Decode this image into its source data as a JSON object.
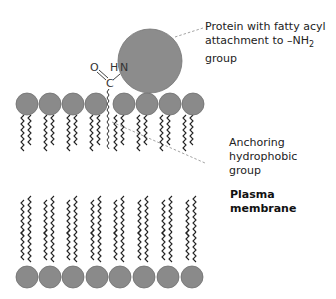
{
  "diagram": {
    "labels": {
      "protein_line1": "Protein with fatty acyl",
      "protein_line2": "attachment to –NH",
      "protein_sub": "2",
      "protein_tail": " group",
      "anchor_line1": "Anchoring",
      "anchor_line2": "hydrophobic",
      "anchor_line3": "group",
      "membrane_line1": "Plasma",
      "membrane_line2": "membrane"
    },
    "atoms": {
      "oxygen": "O",
      "hydrogen": "H",
      "nitrogen": "N",
      "carbon": "C"
    },
    "colors": {
      "head": "#8a8a8a",
      "head_stroke": "#6e6e6e",
      "protein": "#8c8c8c",
      "tail": "#222222",
      "leader": "#888888"
    },
    "top_leaflet_head_x": [
      27,
      50,
      73,
      96,
      120,
      143,
      166,
      189
    ],
    "bottom_leaflet_head_x": [
      27,
      50,
      73,
      97,
      120,
      144,
      168,
      192
    ]
  }
}
